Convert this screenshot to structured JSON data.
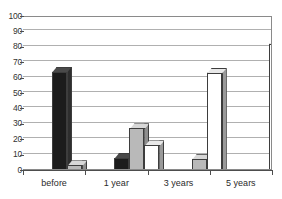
{
  "chart_data": {
    "type": "bar",
    "title": "",
    "subtitle": "",
    "xlabel": "",
    "ylabel": "",
    "categories": [
      "before",
      "1 year",
      "3 years",
      "5 years"
    ],
    "series": [
      {
        "name": "series-1-black",
        "color": "#1c1c1c",
        "values": [
          75,
          19,
          0.5,
          0.5
        ]
      },
      {
        "name": "series-2-gray",
        "color": "#b9b9b9",
        "values": [
          14,
          38,
          18,
          3
        ]
      },
      {
        "name": "series-3-white",
        "color": "#ffffff",
        "values": [
          7,
          27,
          74,
          93
        ]
      }
    ],
    "ylim": [
      0,
      100
    ],
    "ytick_labels": [
      "100",
      "90",
      "80",
      "70",
      "60",
      "50",
      "40",
      "30",
      "20",
      "10",
      "0"
    ],
    "ytick_values": [
      100,
      90,
      80,
      70,
      60,
      50,
      40,
      30,
      20,
      10,
      0
    ],
    "grid": true,
    "grid_axis": "y",
    "legend": false,
    "legend_position": "none",
    "style": "3d-extruded-bars",
    "annotations": []
  },
  "axis_color": "#4d4d4d",
  "gridline_color": "#b0b0b0",
  "plot_border_color": "#8a8a8a",
  "background_color": "#ffffff"
}
